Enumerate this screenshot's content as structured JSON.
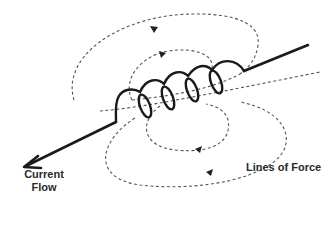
{
  "diagram": {
    "labels": {
      "current_flow_line1": "Current",
      "current_flow_line2": "Flow",
      "lines_of_force": "Lines of Force"
    },
    "components": {
      "wire": "straight conductor entering and leaving coil",
      "coil": "helical coil with 5 turns",
      "field_lines": [
        "outer-top-loop",
        "inner-top-loop",
        "inner-bottom-loop",
        "outer-bottom-loop"
      ],
      "current_arrow": "arrowhead at lower-left wire end"
    },
    "colors": {
      "wire": "#1a1a1a",
      "field_line": "#555555",
      "text": "#2a2a2a",
      "background": "#ffffff"
    }
  }
}
